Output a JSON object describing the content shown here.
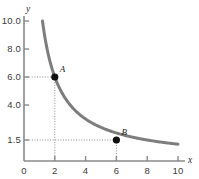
{
  "chart_data": {
    "type": "line",
    "title": "",
    "xlabel": "x",
    "ylabel": "y",
    "xlim": [
      0,
      10.6
    ],
    "ylim": [
      0,
      10.6
    ],
    "grid": false,
    "legend": null,
    "curve": {
      "name": "xy = 12",
      "equation": "y = 12 / x",
      "color": "#7d7d7d",
      "width": 3,
      "x_start": 1.2,
      "x_end": 10.0,
      "points": [
        {
          "x": 1.2,
          "y": 10.0
        },
        {
          "x": 1.5,
          "y": 8.0
        },
        {
          "x": 2.0,
          "y": 6.0
        },
        {
          "x": 2.4,
          "y": 5.0
        },
        {
          "x": 3.0,
          "y": 4.0
        },
        {
          "x": 4.0,
          "y": 3.0
        },
        {
          "x": 4.8,
          "y": 2.5
        },
        {
          "x": 6.0,
          "y": 1.5
        },
        {
          "x": 8.0,
          "y": 1.1
        },
        {
          "x": 10.0,
          "y": 0.85
        }
      ]
    },
    "points": [
      {
        "label": "A",
        "x": 2,
        "y": 6.0,
        "marker": "filled-circle",
        "color": "#101010"
      },
      {
        "label": "B",
        "x": 6,
        "y": 1.5,
        "marker": "filled-circle",
        "color": "#101010"
      }
    ],
    "guide_lines": [
      {
        "from_point": "A",
        "orientation": "horizontal",
        "style": "dotted"
      },
      {
        "from_point": "A",
        "orientation": "vertical",
        "style": "dotted"
      },
      {
        "from_point": "B",
        "orientation": "horizontal",
        "style": "dotted"
      },
      {
        "from_point": "B",
        "orientation": "vertical",
        "style": "dotted"
      }
    ],
    "y_ticks": [
      {
        "value": 10.0,
        "label": "10.0"
      },
      {
        "value": 8.0,
        "label": "8.0"
      },
      {
        "value": 6.0,
        "label": "6.0"
      },
      {
        "value": 4.0,
        "label": "4.0"
      },
      {
        "value": 1.5,
        "label": "1.5"
      }
    ],
    "x_ticks": [
      {
        "value": 2,
        "label": "2"
      },
      {
        "value": 4,
        "label": "4"
      },
      {
        "value": 6,
        "label": "6"
      },
      {
        "value": 8,
        "label": "8"
      },
      {
        "value": 10,
        "label": "10"
      }
    ],
    "origin_label": "0",
    "axis_color": "#8a8a8a",
    "dotted_color": "#8a8a8a"
  }
}
